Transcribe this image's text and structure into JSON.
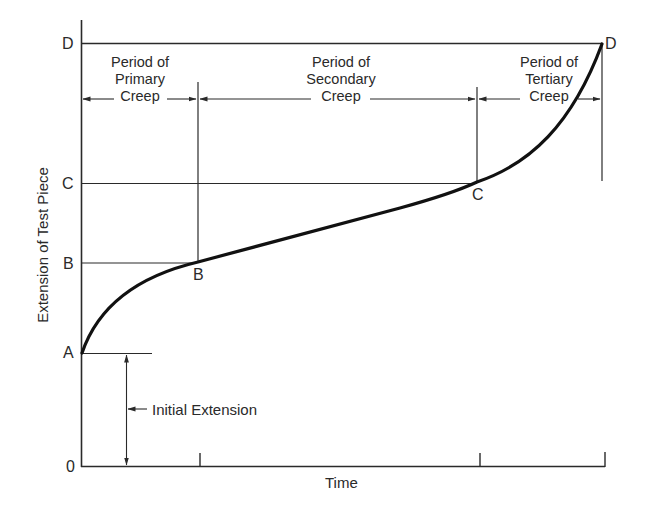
{
  "diagram": {
    "axes": {
      "x_label": "Time",
      "y_label": "Extension of Test Piece",
      "origin_label": "0"
    },
    "y_levels": [
      {
        "name": "A",
        "label": "A"
      },
      {
        "name": "B",
        "label": "B"
      },
      {
        "name": "C",
        "label": "C"
      },
      {
        "name": "D",
        "label": "D"
      }
    ],
    "curve_points": {
      "B": "B",
      "C": "C",
      "D": "D"
    },
    "periods": [
      {
        "id": "primary",
        "line1": "Period of",
        "line2": "Primary",
        "line3": "Creep"
      },
      {
        "id": "secondary",
        "line1": "Period of",
        "line2": "Secondary",
        "line3": "Creep"
      },
      {
        "id": "tertiary",
        "line1": "Period of",
        "line2": "Tertiary",
        "line3": "Creep"
      }
    ],
    "annotations": {
      "initial_extension": "Initial Extension"
    },
    "colors": {
      "line": "#2a2a2a",
      "curve": "#111111",
      "background": "#ffffff"
    }
  }
}
